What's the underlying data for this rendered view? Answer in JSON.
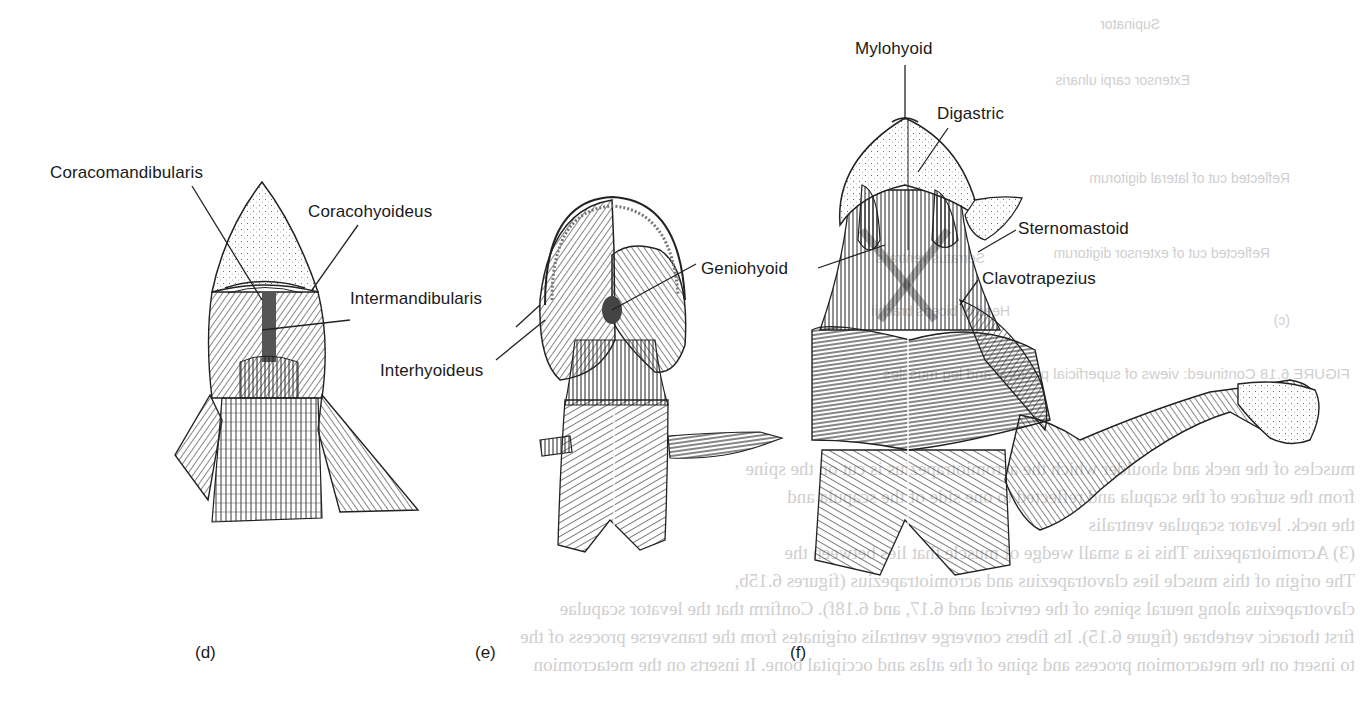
{
  "figure": {
    "panels": [
      {
        "id": "d",
        "letter": "(d)",
        "specimen": "shark",
        "labels": [
          {
            "text": "Coracomandibularis",
            "x": 50,
            "y": 164
          },
          {
            "text": "Coracohyoideus",
            "x": 308,
            "y": 203
          },
          {
            "text": "Intermandibularis",
            "x": 350,
            "y": 290
          }
        ]
      },
      {
        "id": "e",
        "letter": "(e)",
        "specimen": "mudpuppy",
        "labels": [
          {
            "text": "Interhyoideus",
            "x": 380,
            "y": 362
          },
          {
            "text": "Geniohyoid",
            "x": 701,
            "y": 260
          }
        ]
      },
      {
        "id": "f",
        "letter": "(f)",
        "specimen": "cat",
        "labels": [
          {
            "text": "Mylohyoid",
            "x": 855,
            "y": 40
          },
          {
            "text": "Digastric",
            "x": 937,
            "y": 105
          },
          {
            "text": "Sternomastoid",
            "x": 1018,
            "y": 220
          },
          {
            "text": "Clavotrapezius",
            "x": 982,
            "y": 270
          }
        ]
      }
    ],
    "text_color": "#1a1a1a",
    "line_color": "#222222"
  },
  "bleed_through_text": {
    "labels": [
      "Supinator",
      "Extensor carpi ulnaris",
      "Reflected cut of lateral digitorum",
      "Reflected cut of extensor digitorum",
      "Serratus ventralis",
      "Head of biceps brachii",
      "(c)",
      "FIGURE 6.18  Continued: views of superficial pectoral and leg muscles"
    ],
    "body_lines": [
      "muscles of the neck and shoulder which the acromiotrapezius is cut on the spine",
      "from the surface of the scapula and reflected to one side of the scapula and",
      "the neck.                          levator scapulae ventralis",
      "(3) Acromiotrapezius          This is a small wedge of muscle that lies between the",
      "The origin of this muscle lies    clavotrapezius and acromiotrapezius (figures 6.15b,",
      "clavotrapezius along neural spines of the cervical and    6.17, and 6.18f). Confirm that the levator scapulae",
      "first thoracic vertebrae (figure 6.15). Its fibers converge    ventralis originates from the transverse process of the",
      "to insert on the metacromion process and spine of the    atlas and occipital bone. It inserts on the metacromion"
    ]
  }
}
